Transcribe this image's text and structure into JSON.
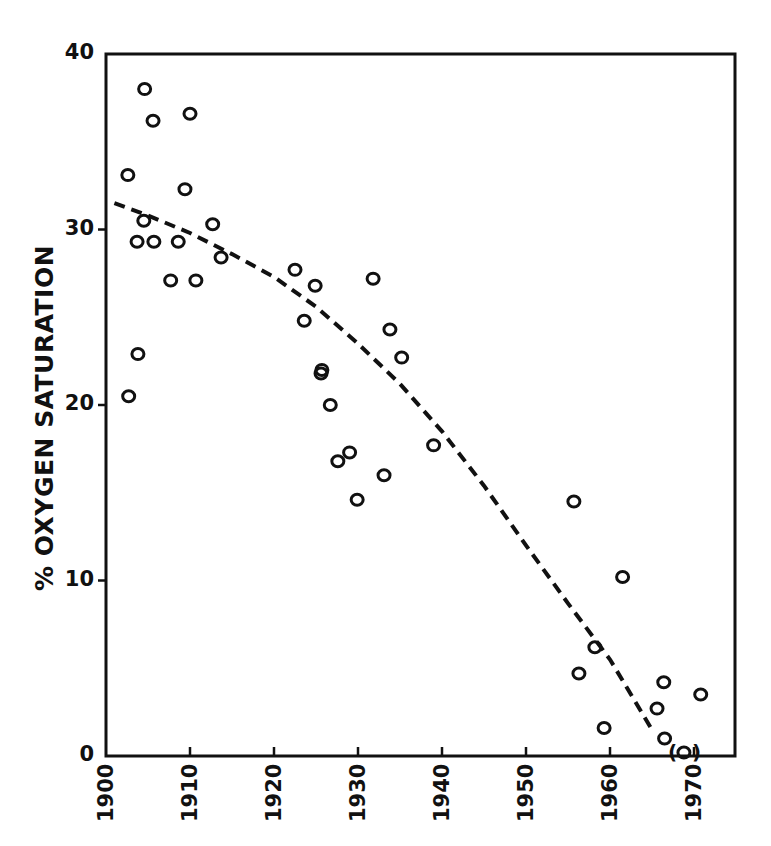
{
  "chart_data": {
    "type": "scatter",
    "title": "",
    "xlabel": "",
    "ylabel": "% OXYGEN SATURATION",
    "xlim": [
      1900,
      1975
    ],
    "ylim": [
      0,
      40
    ],
    "x_ticks": [
      "1900",
      "1910",
      "1920",
      "1930",
      "1940",
      "1950",
      "1960",
      "1970"
    ],
    "y_ticks": [
      "0",
      "10",
      "20",
      "30",
      "40"
    ],
    "grid": false,
    "legend": null,
    "series": [
      {
        "name": "observations",
        "marker": "open-circle",
        "points": [
          {
            "x": 1902.6,
            "y": 33.1
          },
          {
            "x": 1902.7,
            "y": 20.5
          },
          {
            "x": 1903.7,
            "y": 29.3
          },
          {
            "x": 1903.8,
            "y": 22.9
          },
          {
            "x": 1904.5,
            "y": 30.5
          },
          {
            "x": 1904.6,
            "y": 38.0
          },
          {
            "x": 1905.6,
            "y": 36.2
          },
          {
            "x": 1905.7,
            "y": 29.3
          },
          {
            "x": 1907.7,
            "y": 27.1
          },
          {
            "x": 1908.6,
            "y": 29.3
          },
          {
            "x": 1909.4,
            "y": 32.3
          },
          {
            "x": 1910.0,
            "y": 36.6
          },
          {
            "x": 1910.7,
            "y": 27.1
          },
          {
            "x": 1912.7,
            "y": 30.3
          },
          {
            "x": 1913.7,
            "y": 28.4
          },
          {
            "x": 1922.5,
            "y": 27.7
          },
          {
            "x": 1923.6,
            "y": 24.8
          },
          {
            "x": 1924.9,
            "y": 26.8
          },
          {
            "x": 1925.6,
            "y": 21.8
          },
          {
            "x": 1925.7,
            "y": 22.0
          },
          {
            "x": 1926.7,
            "y": 20.0
          },
          {
            "x": 1927.6,
            "y": 16.8
          },
          {
            "x": 1929.0,
            "y": 17.3
          },
          {
            "x": 1929.9,
            "y": 14.6
          },
          {
            "x": 1931.8,
            "y": 27.2
          },
          {
            "x": 1933.1,
            "y": 16.0
          },
          {
            "x": 1933.8,
            "y": 24.3
          },
          {
            "x": 1935.2,
            "y": 22.7
          },
          {
            "x": 1939.0,
            "y": 17.7
          },
          {
            "x": 1955.7,
            "y": 14.5
          },
          {
            "x": 1956.3,
            "y": 4.7
          },
          {
            "x": 1958.2,
            "y": 6.2
          },
          {
            "x": 1959.3,
            "y": 1.6
          },
          {
            "x": 1961.5,
            "y": 10.2
          },
          {
            "x": 1965.6,
            "y": 2.7
          },
          {
            "x": 1966.4,
            "y": 4.2
          },
          {
            "x": 1966.5,
            "y": 1.0
          },
          {
            "x": 1970.8,
            "y": 3.5
          }
        ]
      },
      {
        "name": "bracketed observation",
        "marker": "open-circle-in-parentheses",
        "points": [
          {
            "x": 1968.8,
            "y": 0.2
          }
        ]
      },
      {
        "name": "trend",
        "type": "line",
        "style": "dashed",
        "points": [
          {
            "x": 1901,
            "y": 31.5
          },
          {
            "x": 1905,
            "y": 30.8
          },
          {
            "x": 1910,
            "y": 29.8
          },
          {
            "x": 1915,
            "y": 28.6
          },
          {
            "x": 1920,
            "y": 27.3
          },
          {
            "x": 1925,
            "y": 25.6
          },
          {
            "x": 1930,
            "y": 23.5
          },
          {
            "x": 1935,
            "y": 21.2
          },
          {
            "x": 1940,
            "y": 18.5
          },
          {
            "x": 1945,
            "y": 15.4
          },
          {
            "x": 1950,
            "y": 12.0
          },
          {
            "x": 1955,
            "y": 8.7
          },
          {
            "x": 1960,
            "y": 5.5
          },
          {
            "x": 1965,
            "y": 1.5
          }
        ]
      }
    ]
  },
  "axes": {
    "ylabel": "% OXYGEN SATURATION"
  },
  "colors": {
    "ink": "#111111",
    "background": "#ffffff"
  }
}
